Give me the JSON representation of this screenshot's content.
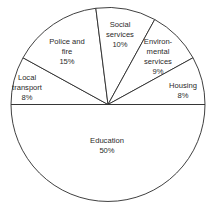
{
  "chart_data": {
    "type": "pie",
    "title": "",
    "start_angle_deg": 180,
    "direction": "clockwise_from_left",
    "slices": [
      {
        "label": "Local transport",
        "lines": [
          "Local",
          "transport",
          "8%"
        ],
        "value": 8,
        "lx": 27,
        "ly": 80
      },
      {
        "label": "Police and fire",
        "lines": [
          "Police and",
          "fire",
          "15%"
        ],
        "value": 15,
        "lx": 67,
        "ly": 44
      },
      {
        "label": "Social services",
        "lines": [
          "Social",
          "services",
          "10%"
        ],
        "value": 10,
        "lx": 120,
        "ly": 27
      },
      {
        "label": "Environmental services",
        "lines": [
          "Environ-",
          "mental",
          "services",
          "9%"
        ],
        "value": 9,
        "lx": 158,
        "ly": 44
      },
      {
        "label": "Housing",
        "lines": [
          "Housing",
          "8%"
        ],
        "value": 8,
        "lx": 183,
        "ly": 88
      },
      {
        "label": "Education",
        "lines": [
          "Education",
          "50%"
        ],
        "value": 50,
        "lx": 107,
        "ly": 143
      }
    ],
    "center": [
      108,
      104.5
    ],
    "radius": 97
  }
}
